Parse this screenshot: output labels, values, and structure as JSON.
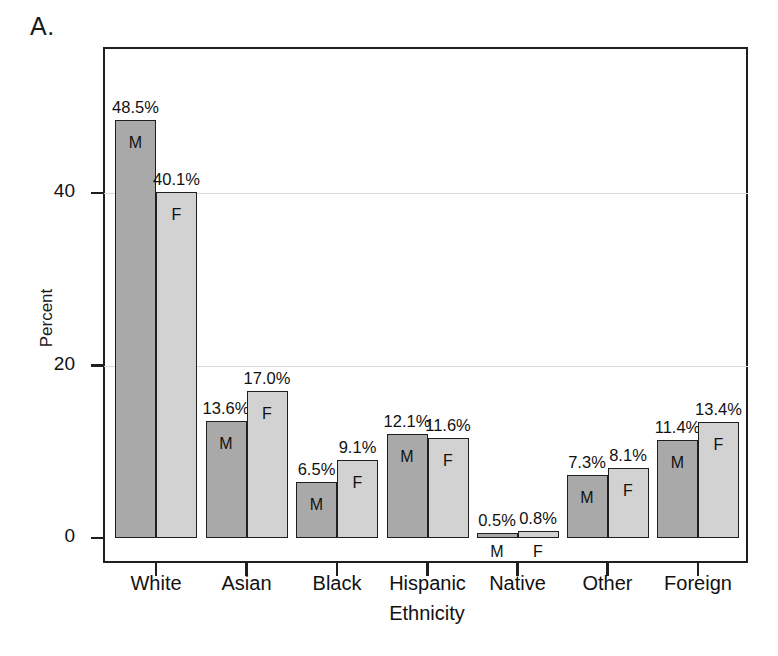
{
  "figure": {
    "panel_label": "A."
  },
  "chart_data": {
    "type": "bar",
    "title": "",
    "subtitle": "",
    "xlabel": "Ethnicity",
    "ylabel": "Percent",
    "categories": [
      "White",
      "Asian",
      "Black",
      "Hispanic",
      "Native",
      "Other",
      "Foreign"
    ],
    "series": [
      {
        "name": "M",
        "label": "M",
        "color": "#a9a9a9",
        "values": [
          48.5,
          13.6,
          6.5,
          12.1,
          0.5,
          7.3,
          11.4
        ],
        "value_labels": [
          "48.5%",
          "13.6%",
          "6.5%",
          "12.1%",
          "0.5%",
          "7.3%",
          "11.4%"
        ]
      },
      {
        "name": "F",
        "label": "F",
        "color": "#d2d2d2",
        "values": [
          40.1,
          17.0,
          9.1,
          11.6,
          0.8,
          8.1,
          13.4
        ],
        "value_labels": [
          "40.1%",
          "17.0%",
          "9.1%",
          "11.6%",
          "0.8%",
          "8.1%",
          "13.4%"
        ]
      }
    ],
    "ylim": [
      0,
      55
    ],
    "yticks": [
      0,
      20,
      40
    ],
    "ytick_labels": [
      "0",
      "20",
      "40"
    ],
    "grid": "horizontal",
    "gridlines_at": [
      20,
      40
    ],
    "legend": "inline-bar-labels",
    "axis_color": "#1f1f1f",
    "grid_color": "#d9d9d9",
    "background": "#ffffff"
  }
}
